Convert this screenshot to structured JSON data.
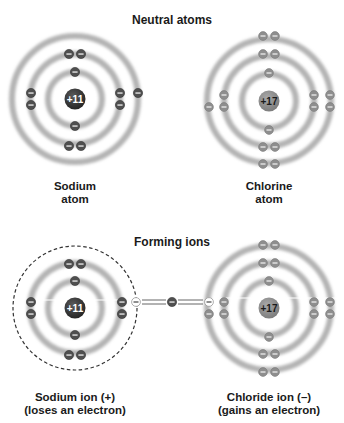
{
  "sections": {
    "neutral": {
      "title": "Neutral atoms"
    },
    "ions": {
      "title": "Forming ions"
    }
  },
  "atoms": {
    "sodium_atom": {
      "nucleus_label": "+11",
      "label_line1": "Sodium",
      "label_line2": "atom",
      "center": [
        75,
        99
      ],
      "shells": [
        2,
        8,
        1
      ]
    },
    "chlorine_atom": {
      "nucleus_label": "+17",
      "label_line1": "Chlorine",
      "label_line2": "atom",
      "center": [
        269,
        101
      ],
      "shells": [
        2,
        8,
        7
      ]
    },
    "sodium_ion": {
      "nucleus_label": "+11",
      "label_line1": "Sodium ion (+)",
      "label_line2": "(loses an electron)",
      "center": [
        75,
        308
      ],
      "shells": [
        2,
        8
      ]
    },
    "chloride_ion": {
      "nucleus_label": "+17",
      "label_line1": "Chloride ion (–)",
      "label_line2": "(gains an electron)",
      "center": [
        269,
        308
      ],
      "shells": [
        2,
        8,
        8
      ]
    }
  },
  "colors": {
    "sodium_nucleus": "#3a3a3a",
    "chlorine_nucleus": "#8c8c8c",
    "sodium_electron": "#555555",
    "chlorine_electron": "#8a8a8a",
    "ring": "#b5b5b5",
    "text": "#1a1a1a"
  },
  "electron_symbol": "−"
}
